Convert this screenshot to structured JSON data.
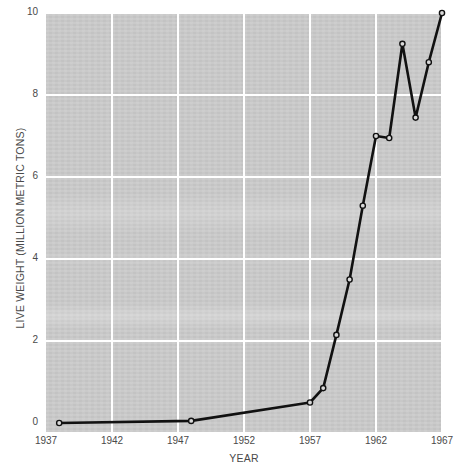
{
  "chart_data": {
    "type": "line",
    "title": "",
    "xlabel": "YEAR",
    "ylabel": "LIVE WEIGHT (MILLION METRIC TONS)",
    "xlim": [
      1937,
      1967
    ],
    "ylim": [
      0,
      10
    ],
    "xticks": [
      1937,
      1942,
      1947,
      1952,
      1957,
      1962,
      1967
    ],
    "xticklabels": [
      "1937",
      "1942",
      "1947",
      "1952",
      "1957",
      "1962",
      "1967"
    ],
    "yticks": [
      0,
      2,
      4,
      6,
      8,
      10
    ],
    "yticklabels": [
      "0",
      "2",
      "4",
      "6",
      "8",
      "10"
    ],
    "grid": true,
    "grid_color": "#ffffff",
    "plot_background": "#cacaca",
    "page_background": "#ffffff",
    "line_color": "#000000",
    "marker": "circle-open",
    "legend": null,
    "x": [
      1938,
      1948,
      1957,
      1958,
      1959,
      1960,
      1961,
      1962,
      1963,
      1964,
      1965,
      1966,
      1967
    ],
    "values": [
      0.0,
      0.05,
      0.5,
      0.85,
      2.15,
      3.5,
      5.3,
      7.0,
      6.95,
      9.25,
      7.45,
      8.8,
      10.0
    ],
    "series": [
      {
        "name": "Live weight",
        "points": [
          {
            "x": 1938,
            "y": 0.0
          },
          {
            "x": 1948,
            "y": 0.05
          },
          {
            "x": 1957,
            "y": 0.5
          },
          {
            "x": 1958,
            "y": 0.85
          },
          {
            "x": 1959,
            "y": 2.15
          },
          {
            "x": 1960,
            "y": 3.5
          },
          {
            "x": 1961,
            "y": 5.3
          },
          {
            "x": 1962,
            "y": 7.0
          },
          {
            "x": 1963,
            "y": 6.95
          },
          {
            "x": 1964,
            "y": 9.25
          },
          {
            "x": 1965,
            "y": 7.45
          },
          {
            "x": 1966,
            "y": 8.8
          },
          {
            "x": 1967,
            "y": 10.0
          }
        ]
      }
    ]
  }
}
